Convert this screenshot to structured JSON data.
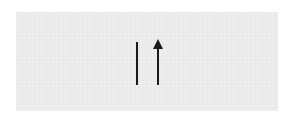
{
  "panel": {
    "background_color": "#ececec"
  },
  "symbols": [
    {
      "name": "vertical-bar",
      "glyph": "|",
      "color": "#1a1a1a"
    },
    {
      "name": "up-arrow",
      "glyph": "↑",
      "color": "#1a1a1a"
    }
  ]
}
